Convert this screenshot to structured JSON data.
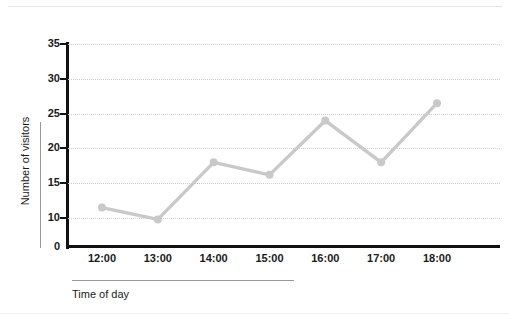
{
  "chart_data": {
    "type": "line",
    "title": "",
    "subtitle": "",
    "xlabel": "Time of day",
    "ylabel": "Number of visitors",
    "categories": [
      "12:00",
      "13:00",
      "14:00",
      "15:00",
      "16:00",
      "17:00",
      "18:00"
    ],
    "values": [
      11.5,
      9.8,
      18,
      16.2,
      24,
      18,
      26.5
    ],
    "series": [
      {
        "name": "Number of visitors",
        "values": [
          11.5,
          9.8,
          18,
          16.2,
          24,
          18,
          26.5
        ]
      }
    ],
    "ytick_labels": [
      "35",
      "30",
      "25",
      "20",
      "15",
      "10",
      "0"
    ],
    "ytick_values": [
      35,
      30,
      25,
      20,
      15,
      10,
      0
    ],
    "ylim": [
      0,
      35
    ],
    "y_axis_broken_between": [
      0,
      10
    ],
    "grid": "horizontal-dotted",
    "legend": "none",
    "marker": "circle",
    "colors": {
      "series_line": "#c9c9c9",
      "marker_fill": "#c9c9c9",
      "axis": "#111111",
      "gridline": "#cfcfcf",
      "axis_title_rule": "#9a9a9a",
      "text": "#1a1a1a",
      "background": "#ffffff"
    },
    "annotations": []
  },
  "icons": {
    "marker": "circle-marker-icon"
  }
}
